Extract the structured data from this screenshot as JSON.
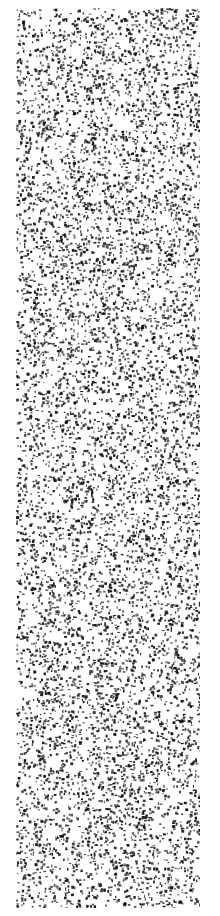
{
  "image": {
    "width": 220,
    "height": 916,
    "background_color": "#ffffff",
    "speckle_color": "#111111",
    "content_region": {
      "x": 16,
      "y": 8,
      "width": 184,
      "height": 900
    },
    "description": "Uniform black speckle noise texture on white; no text, icons, or UI controls visible"
  },
  "texture": {
    "seed": 1337,
    "speckle_count": 9000,
    "min_size": 1,
    "max_size": 3
  }
}
